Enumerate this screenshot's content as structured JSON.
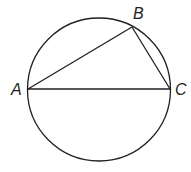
{
  "diagram": {
    "type": "inscribed-triangle-in-circle",
    "circle": {
      "cx": 99,
      "cy": 89.5,
      "r": 71.5
    },
    "points": {
      "A": {
        "label": "A",
        "x": 28,
        "y": 89
      },
      "B": {
        "label": "B",
        "x": 132,
        "y": 27
      },
      "C": {
        "label": "C",
        "x": 170,
        "y": 89
      }
    },
    "segments": [
      "AB",
      "BC",
      "AC"
    ],
    "stroke_color": "#231f20"
  }
}
